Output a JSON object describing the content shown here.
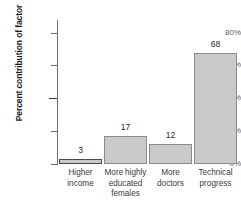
{
  "chart_data": {
    "type": "bar",
    "title": "",
    "xlabel": "",
    "ylabel": "Percent contribution of factor",
    "categories": [
      "Higher income",
      "More highly educated females",
      "More doctors",
      "Technical progress"
    ],
    "values": [
      3,
      17,
      12,
      68
    ],
    "value_labels": [
      "3",
      "17",
      "12",
      "68"
    ],
    "ylim": [
      0,
      88
    ],
    "yticks": [
      0,
      20,
      40,
      60,
      80
    ],
    "ytick_labels": [
      "0%",
      "20%",
      "40%",
      "60%",
      "80%"
    ],
    "grid": false,
    "legend": null,
    "bar_color": "#c9c9c9",
    "bar_border_color": "#8c8c8c",
    "axis_color": "#6e6e6e"
  },
  "axis": {
    "y_title": "Percent contribution of factor"
  }
}
